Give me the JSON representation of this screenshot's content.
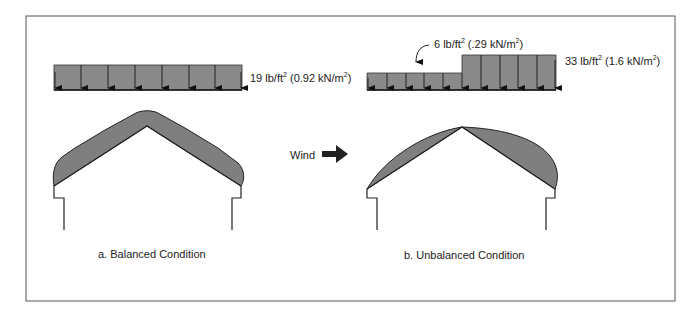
{
  "figure": {
    "colors": {
      "load_fill": "#8a8a8a",
      "snow_fill": "#7f7f7f",
      "stroke": "#222222",
      "frame": "#555555"
    }
  },
  "balanced": {
    "load_label": {
      "value": "19 lb/ft",
      "sup": "2",
      "metric_open": " (0.92 kN/m",
      "metric_sup": "2",
      "close": ")"
    },
    "caption": "a. Balanced Condition"
  },
  "wind": {
    "label": "Wind",
    "icon": "right-arrow-icon"
  },
  "unbalanced": {
    "low_load_label": {
      "value": "6 lb/ft",
      "sup": "2",
      "metric_open": " (.29 kN/m",
      "metric_sup": "2",
      "close": ")"
    },
    "high_load_label": {
      "value": "33 lb/ft",
      "sup": "2",
      "metric_open": " (1.6 kN/m",
      "metric_sup": "2",
      "close": ")"
    },
    "caption": "b. Unbalanced Condition"
  }
}
